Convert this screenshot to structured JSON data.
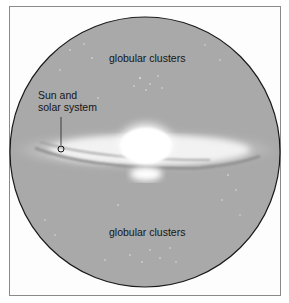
{
  "diagram": {
    "labels": {
      "top_clusters": "globular clusters",
      "bottom_clusters": "globular clusters",
      "sun_line1": "Sun and",
      "sun_line2": "solar system"
    },
    "colors": {
      "halo": "#a9a9a9",
      "halo_outline": "#1a1a1a",
      "frame": "#8a8a8a",
      "bulge": "#ffffff",
      "text": "#151515"
    }
  }
}
